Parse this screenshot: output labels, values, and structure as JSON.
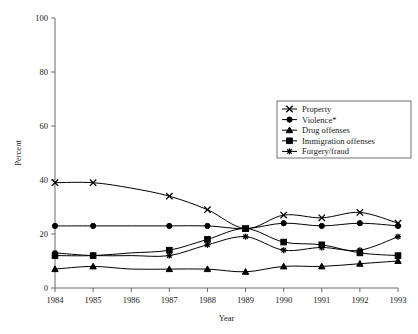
{
  "chart_data": {
    "type": "line",
    "title": "",
    "xlabel": "Year",
    "ylabel": "Percent",
    "xlim": [
      1984,
      1993
    ],
    "ylim": [
      0,
      100
    ],
    "yticks": [
      0,
      20,
      40,
      60,
      80,
      100
    ],
    "grid": false,
    "legend_position": "upper right",
    "categories": [
      1984,
      1985,
      1986,
      1987,
      1988,
      1989,
      1990,
      1991,
      1992,
      1993
    ],
    "x": [
      "1984",
      "1985",
      "1986",
      "1987",
      "1988",
      "1989",
      "1990",
      "1991",
      "1992",
      "1993"
    ],
    "series": [
      {
        "name": "Property",
        "marker": "x",
        "values": [
          39,
          39,
          37,
          34,
          29,
          22,
          27,
          26,
          28,
          24
        ]
      },
      {
        "name": "Violence*",
        "marker": "circle",
        "values": [
          23,
          23,
          23,
          23,
          23,
          22,
          24,
          23,
          24,
          23
        ]
      },
      {
        "name": "Drug offenses",
        "marker": "triangle",
        "values": [
          7,
          8,
          7,
          7,
          7,
          6,
          8,
          8,
          9,
          10
        ]
      },
      {
        "name": "Immigration offenses",
        "marker": "square",
        "values": [
          12,
          12,
          13,
          14,
          18,
          22,
          17,
          16,
          13,
          12
        ]
      },
      {
        "name": "Forgery/fraud",
        "marker": "asterisk",
        "values": [
          13,
          12,
          12,
          12,
          16,
          19,
          14,
          15,
          14,
          19
        ]
      }
    ]
  },
  "axes": {
    "y_tick_labels": [
      "0",
      "20",
      "40",
      "60",
      "80",
      "100"
    ],
    "x_tick_labels": [
      "1984",
      "1985",
      "1986",
      "1987",
      "1988",
      "1989",
      "1990",
      "1991",
      "1992",
      "1993"
    ],
    "y_axis_title": "Percent",
    "x_axis_title": "Year"
  },
  "legend": {
    "items": [
      {
        "label": "Property",
        "marker": "x"
      },
      {
        "label": "Violence*",
        "marker": "circle"
      },
      {
        "label": "Drug offenses",
        "marker": "triangle"
      },
      {
        "label": "Immigration offenses",
        "marker": "square"
      },
      {
        "label": "Forgery/fraud",
        "marker": "asterisk"
      }
    ]
  },
  "colors": {
    "line": "#000000",
    "axis": "#6b6b6b",
    "text": "#1a1a1a",
    "background": "#ffffff",
    "legend_border": "#707070"
  }
}
